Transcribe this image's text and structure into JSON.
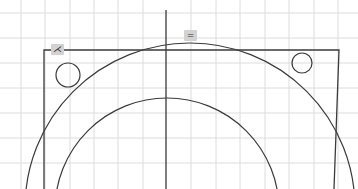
{
  "canvas": {
    "width": 358,
    "height": 189,
    "background": "#ffffff",
    "grid": {
      "color": "#dcdcdc",
      "vertical_x": [
        21,
        45,
        70,
        94,
        118,
        143,
        191,
        216,
        240,
        265,
        289,
        314,
        338
      ],
      "horizontal_y": [
        13,
        38,
        63,
        88,
        113,
        138,
        163
      ]
    },
    "stroke_color": "#3a3a3a",
    "axis_line": {
      "x": 166,
      "y1": 10,
      "y2": 189
    },
    "rectangle": {
      "top_y": 50,
      "left_x": 44,
      "right_x_top": 339,
      "right_x_bottom": 334
    },
    "outer_arc": {
      "cx": 190,
      "cy": 208,
      "r": 165
    },
    "inner_arc": {
      "cx": 167,
      "cy": 210,
      "r": 112
    },
    "holes": [
      {
        "name": "left-hole",
        "cx": 68,
        "cy": 75,
        "r": 12
      },
      {
        "name": "right-hole",
        "cx": 302,
        "cy": 63,
        "r": 10
      }
    ]
  },
  "markers": {
    "corner_marker": {
      "glyph": "⋌",
      "x": 51,
      "y": 44,
      "meaning": "perpendicular-constraint"
    },
    "top_marker": {
      "glyph": "=",
      "x": 184,
      "y": 30,
      "meaning": "equal-constraint"
    }
  }
}
